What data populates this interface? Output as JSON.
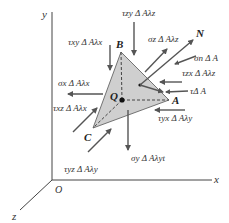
{
  "axes": {
    "x_label": "x",
    "y_label": "y",
    "z_label": "z",
    "origin_label": "O"
  },
  "vertices": {
    "A": "A",
    "B": "B",
    "C": "C",
    "Q": "Q",
    "N": "N"
  },
  "forces": {
    "tau_xy": "τxy Δ Aλx",
    "tau_zy": "τzy Δ Aλz",
    "sigma_z": "σz Δ Aλz",
    "sigma_n": "σn Δ A",
    "tau_zx": "τzx Δ Aλz",
    "tau": "τΔ A",
    "sigma_x": "σx Δ Aλx",
    "tau_xz": "τxz Δ Aλx",
    "tau_yx": "τyx Δ Aλy",
    "tau_yz": "τyz Δ Aλy",
    "sigma_y": "σy Δ Aλyt"
  },
  "colors": {
    "tetra_fill": "#cfcfcf",
    "line": "#444444",
    "arrow": "#555555"
  }
}
